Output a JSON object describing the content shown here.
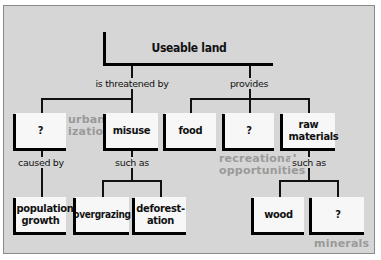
{
  "diagram": {
    "root": {
      "label": "Useable land"
    },
    "relations": {
      "threatened": "is threatened by",
      "provides": "provides",
      "caused_by": "caused by",
      "such_as_misuse": "such as",
      "such_as_raw": "such as"
    },
    "threats": [
      {
        "label": "?",
        "answer": "urban-\nization"
      },
      {
        "label": "misuse"
      }
    ],
    "provisions": [
      {
        "label": "food"
      },
      {
        "label": "?",
        "answer": "recreational\nopportunities"
      },
      {
        "label": "raw materials"
      }
    ],
    "causes": [
      {
        "label": "population growth"
      }
    ],
    "misuse_examples": [
      {
        "label": "overgrazing"
      },
      {
        "label": "deforest-\nation"
      }
    ],
    "raw_material_examples": [
      {
        "label": "wood"
      },
      {
        "label": "?",
        "answer": "minerals"
      }
    ],
    "colors": {
      "panel": "#d6d6d6",
      "box": "#f7f7f7",
      "line": "#111111",
      "answer_text": "#9a9a9a"
    }
  }
}
